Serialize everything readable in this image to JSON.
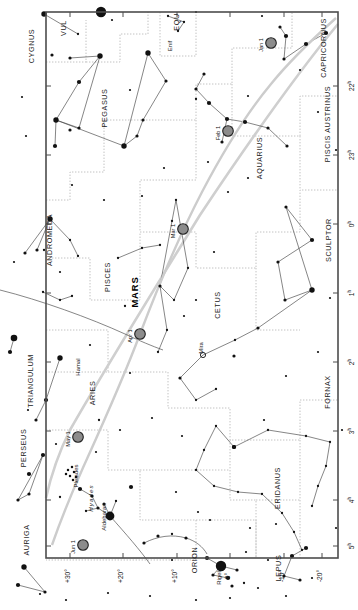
{
  "chart_data": {
    "type": "scatter",
    "title": "MARS",
    "xlabel": "Right Ascension",
    "ylabel": "Declination",
    "orientation": "rotated-90-ccw",
    "grid": true,
    "frame": {
      "x": 46,
      "y": 12,
      "w": 292,
      "h": 546
    },
    "ra_axis": {
      "label_suffix": "h",
      "ticks": [
        "22",
        "23",
        "0",
        "1",
        "2",
        "3",
        "4",
        "5"
      ],
      "positions_px": [
        86,
        155,
        224,
        293,
        362,
        431,
        500,
        546
      ],
      "range": [
        21.5,
        5.5
      ]
    },
    "dec_axis": {
      "ticks": [
        "+30°",
        "+20°",
        "+10°",
        "0°",
        "-10°",
        "-20°"
      ],
      "range": [
        -25,
        35
      ]
    },
    "constellations": [
      {
        "name": "CYGNUS",
        "x": 34,
        "y": 46
      },
      {
        "name": "VUL",
        "x": 66,
        "y": 28
      },
      {
        "name": "EQU",
        "x": 179,
        "y": 22
      },
      {
        "name": "PEGASUS",
        "x": 107,
        "y": 108
      },
      {
        "name": "CAPRICORNUS",
        "x": 326,
        "y": 48
      },
      {
        "name": "PISCIS AUSTRINUS",
        "x": 330,
        "y": 124
      },
      {
        "name": "AQUARIUS",
        "x": 262,
        "y": 158
      },
      {
        "name": "ANDROMEDA",
        "x": 52,
        "y": 240
      },
      {
        "name": "PISCES",
        "x": 110,
        "y": 277
      },
      {
        "name": "CETUS",
        "x": 220,
        "y": 305
      },
      {
        "name": "SCULPTOR",
        "x": 331,
        "y": 240
      },
      {
        "name": "TRIANGULUM",
        "x": 33,
        "y": 381
      },
      {
        "name": "ARIES",
        "x": 95,
        "y": 393
      },
      {
        "name": "PERSEUS",
        "x": 26,
        "y": 448
      },
      {
        "name": "FORNAX",
        "x": 330,
        "y": 392
      },
      {
        "name": "ERIDANUS",
        "x": 280,
        "y": 488
      },
      {
        "name": "AURIGA",
        "x": 29,
        "y": 540
      },
      {
        "name": "ORION",
        "x": 197,
        "y": 560
      },
      {
        "name": "LEPUS",
        "x": 281,
        "y": 568
      }
    ],
    "named_stars": [
      {
        "name": "Enif",
        "x": 172,
        "y": 46,
        "mag": 2.4
      },
      {
        "name": "Hamal",
        "x": 80,
        "y": 367,
        "mag": 2.0
      },
      {
        "name": "Aldebaran",
        "x": 106,
        "y": 517,
        "mag": 0.9
      },
      {
        "name": "Rigel",
        "x": 221,
        "y": 578,
        "mag": 0.1
      },
      {
        "name": "Mira",
        "x": 203,
        "y": 348,
        "mag": 3.5,
        "variable": true
      }
    ],
    "clusters": [
      {
        "name": "Pleiades",
        "x": 78,
        "y": 476,
        "style": "plain"
      },
      {
        "name": "Hyades",
        "x": 93,
        "y": 498,
        "style": "italic"
      }
    ],
    "planet": {
      "name": "MARS",
      "label_x": 138,
      "label_y": 292,
      "marker_color": "#8c8c8c",
      "marker_edge": "#222222",
      "path_color": "#cccccc",
      "date_markers": [
        {
          "label": "Jan 1",
          "x": 271,
          "y": 43
        },
        {
          "label": "Feb 1",
          "x": 228,
          "y": 131
        },
        {
          "label": "Mar 1",
          "x": 183,
          "y": 229
        },
        {
          "label": "Apr 1",
          "x": 140,
          "y": 334
        },
        {
          "label": "May 1",
          "x": 78,
          "y": 437
        },
        {
          "label": "Jun 1",
          "x": 83,
          "y": 545
        }
      ]
    },
    "colors": {
      "background": "#ffffff",
      "frame": "#4d4d4d",
      "star": "#111111",
      "constellation_line": "#444444",
      "boundary": "#bbbbbb",
      "ecliptic": "#cfcfcf"
    }
  }
}
